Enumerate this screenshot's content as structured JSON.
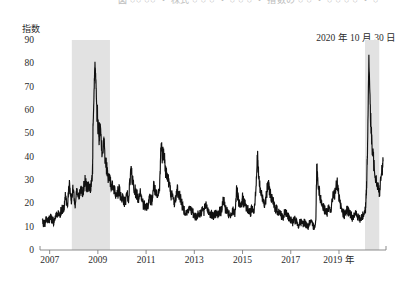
{
  "figure": {
    "caption_top": "図  ○○  ○○  ・ 株式  ○ ○ ○ ・ ○ ○ ○ ・ 指数の  ○ ○ ・ ○ ○ ○ ○ ・ ○",
    "annotation": "2020 年 10 月 30 日",
    "unit_label": "指数",
    "background_color": "#ffffff",
    "line_color": "#111111",
    "band_color": "#e2e2e2",
    "axis_color": "#808080"
  },
  "chart_data": {
    "type": "line",
    "title": "",
    "subtitle": "",
    "xlabel": "年",
    "ylabel": "指数",
    "ylim": [
      0,
      90
    ],
    "xlim": [
      2006.6,
      2020.95
    ],
    "grid": false,
    "legend": "none",
    "y_ticks": [
      90,
      80,
      70,
      60,
      50,
      40,
      30,
      20,
      10,
      0
    ],
    "x_ticks": [
      "2007",
      "2009",
      "2011",
      "2013",
      "2015",
      "2017",
      "2019 年"
    ],
    "x_tick_values": [
      2007,
      2009,
      2011,
      2013,
      2015,
      2017,
      2019
    ],
    "annotations": [
      {
        "text": "2020 年 10 月 30 日",
        "position": "top-right"
      }
    ],
    "shaded_bands": [
      {
        "label": "景気後退期",
        "x_start": 2007.92,
        "x_end": 2009.5,
        "color": "#e2e2e2"
      },
      {
        "label": "景気後退期",
        "x_start": 2020.08,
        "x_end": 2020.67,
        "color": "#e2e2e2"
      }
    ],
    "series": [
      {
        "name": "ボラティリティ指数",
        "color": "#111111",
        "x": [
          2006.7,
          2006.78,
          2006.86,
          2006.94,
          2007.02,
          2007.1,
          2007.18,
          2007.26,
          2007.34,
          2007.42,
          2007.5,
          2007.58,
          2007.66,
          2007.74,
          2007.82,
          2007.9,
          2007.98,
          2008.06,
          2008.14,
          2008.22,
          2008.3,
          2008.38,
          2008.46,
          2008.54,
          2008.62,
          2008.7,
          2008.78,
          2008.8,
          2008.84,
          2008.88,
          2008.92,
          2008.96,
          2009.0,
          2009.04,
          2009.08,
          2009.16,
          2009.24,
          2009.32,
          2009.4,
          2009.48,
          2009.56,
          2009.64,
          2009.72,
          2009.8,
          2009.88,
          2009.96,
          2010.04,
          2010.12,
          2010.2,
          2010.28,
          2010.36,
          2010.44,
          2010.52,
          2010.6,
          2010.68,
          2010.76,
          2010.84,
          2010.92,
          2011.0,
          2011.08,
          2011.16,
          2011.24,
          2011.32,
          2011.4,
          2011.48,
          2011.56,
          2011.62,
          2011.68,
          2011.74,
          2011.8,
          2011.88,
          2011.96,
          2012.04,
          2012.12,
          2012.2,
          2012.28,
          2012.36,
          2012.44,
          2012.52,
          2012.6,
          2012.68,
          2012.76,
          2012.84,
          2012.92,
          2013.0,
          2013.08,
          2013.16,
          2013.24,
          2013.32,
          2013.4,
          2013.48,
          2013.56,
          2013.64,
          2013.72,
          2013.8,
          2013.88,
          2013.96,
          2014.04,
          2014.12,
          2014.2,
          2014.28,
          2014.36,
          2014.44,
          2014.52,
          2014.6,
          2014.68,
          2014.76,
          2014.84,
          2014.92,
          2015.0,
          2015.08,
          2015.16,
          2015.24,
          2015.32,
          2015.4,
          2015.48,
          2015.56,
          2015.62,
          2015.68,
          2015.76,
          2015.84,
          2015.92,
          2016.0,
          2016.05,
          2016.12,
          2016.2,
          2016.28,
          2016.36,
          2016.44,
          2016.52,
          2016.6,
          2016.68,
          2016.76,
          2016.84,
          2016.92,
          2017.0,
          2017.08,
          2017.16,
          2017.24,
          2017.32,
          2017.4,
          2017.48,
          2017.56,
          2017.64,
          2017.72,
          2017.8,
          2017.88,
          2017.96,
          2018.04,
          2018.08,
          2018.12,
          2018.2,
          2018.28,
          2018.36,
          2018.44,
          2018.52,
          2018.6,
          2018.68,
          2018.76,
          2018.84,
          2018.92,
          2019.0,
          2019.08,
          2019.16,
          2019.24,
          2019.32,
          2019.4,
          2019.48,
          2019.56,
          2019.64,
          2019.72,
          2019.8,
          2019.88,
          2019.96,
          2020.04,
          2020.1,
          2020.14,
          2020.18,
          2020.24,
          2020.3,
          2020.36,
          2020.44,
          2020.52,
          2020.6,
          2020.68,
          2020.76,
          2020.83
        ],
        "y": [
          12,
          11,
          13,
          12,
          14,
          13,
          12,
          14,
          16,
          15,
          18,
          17,
          24,
          20,
          28,
          22,
          26,
          20,
          25,
          22,
          27,
          24,
          30,
          26,
          29,
          26,
          34,
          52,
          68,
          80,
          72,
          60,
          55,
          48,
          52,
          44,
          46,
          38,
          33,
          30,
          28,
          26,
          25,
          24,
          26,
          23,
          22,
          20,
          24,
          22,
          34,
          30,
          26,
          24,
          22,
          25,
          20,
          19,
          18,
          20,
          22,
          21,
          28,
          24,
          22,
          26,
          46,
          40,
          44,
          34,
          32,
          28,
          24,
          22,
          20,
          26,
          24,
          22,
          18,
          17,
          16,
          17,
          18,
          16,
          15,
          14,
          16,
          15,
          18,
          16,
          20,
          17,
          16,
          15,
          14,
          16,
          15,
          17,
          16,
          22,
          18,
          16,
          15,
          14,
          17,
          16,
          26,
          20,
          18,
          22,
          20,
          18,
          17,
          16,
          18,
          17,
          28,
          40,
          30,
          24,
          22,
          20,
          24,
          28,
          26,
          22,
          20,
          18,
          17,
          16,
          15,
          14,
          16,
          15,
          14,
          13,
          12,
          13,
          12,
          11,
          12,
          11,
          12,
          11,
          10,
          12,
          11,
          10,
          12,
          37,
          30,
          24,
          20,
          18,
          17,
          16,
          18,
          17,
          25,
          24,
          30,
          22,
          18,
          16,
          15,
          17,
          16,
          15,
          14,
          16,
          15,
          14,
          13,
          14,
          16,
          18,
          26,
          40,
          83,
          60,
          45,
          38,
          32,
          28,
          25,
          32,
          38
        ]
      }
    ]
  }
}
